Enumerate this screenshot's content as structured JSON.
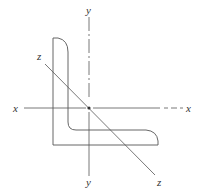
{
  "diagram": {
    "axes": {
      "x": {
        "label_left": "x",
        "label_right": "x"
      },
      "y": {
        "label_top": "y",
        "label_bottom": "y"
      },
      "z": {
        "label_top": "z",
        "label_bottom": "z"
      }
    },
    "centroid": {
      "marker": "dot"
    },
    "colors": {
      "line": "#555555",
      "text": "#333333",
      "background": "#ffffff"
    }
  }
}
